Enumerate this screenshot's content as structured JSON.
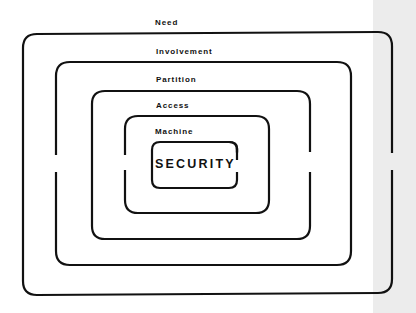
{
  "diagram": {
    "type": "nested-rings",
    "stroke_color": "#111111",
    "background": "#ffffff",
    "page_edge_color": "#ececec",
    "core_label": "SECURITY",
    "layers": [
      {
        "label": "Need",
        "order": 1
      },
      {
        "label": "Involvement",
        "order": 2
      },
      {
        "label": "Partition",
        "order": 3
      },
      {
        "label": "Access",
        "order": 4
      },
      {
        "label": "Machine",
        "order": 5
      }
    ]
  }
}
